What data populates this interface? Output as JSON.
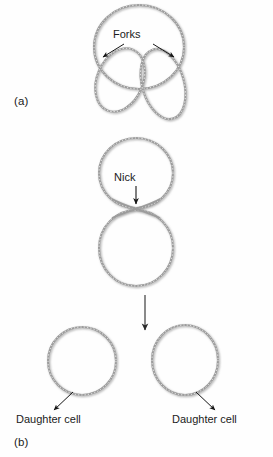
{
  "figure": {
    "background_color": "#fefefe",
    "stroke_color": "#9a9a9a",
    "stroke_color_dark": "#7d7d7d",
    "text_color": "#1b1b1b",
    "arrow_color": "#161616",
    "width": 273,
    "height": 457
  },
  "panels": [
    {
      "letter": "(a)",
      "caption_letter": "(a)",
      "description": "theta replication intermediate",
      "labels": [
        {
          "name": "forks",
          "text": "Forks",
          "arrow_count": 2
        }
      ]
    },
    {
      "letter": "(b)",
      "caption_letter": "(b)",
      "description": "nicked chromosome separating into two daughter cells",
      "labels": [
        {
          "name": "nick",
          "text": "Nick",
          "arrow_count": 1
        },
        {
          "name": "daughter-cell-left",
          "text": "Daughter cell",
          "arrow_count": 1
        },
        {
          "name": "daughter-cell-right",
          "text": "Daughter cell",
          "arrow_count": 1
        }
      ]
    }
  ],
  "labels": {
    "panel_a": "(a)",
    "panel_b": "(b)",
    "forks": "Forks",
    "nick": "Nick",
    "daughter_cell_left": "Daughter cell",
    "daughter_cell_right": "Daughter cell"
  },
  "shapes": {
    "theta_outer_circle": {
      "cx": 139,
      "cy": 47,
      "rx": 45,
      "ry": 42
    },
    "theta_loop_left": {
      "cx": 119,
      "cy": 80,
      "rx": 22,
      "ry": 33
    },
    "theta_loop_right": {
      "cx": 164,
      "cy": 83,
      "rx": 21,
      "ry": 36
    },
    "nicked_circle_top": {
      "cx": 136,
      "cy": 173,
      "rx": 37,
      "ry": 35
    },
    "nicked_circle_bottom": {
      "cx": 136,
      "cy": 248,
      "rx": 37,
      "ry": 38
    },
    "daughter_circle_left": {
      "cx": 82,
      "cy": 361,
      "rx": 34,
      "ry": 34
    },
    "daughter_circle_right": {
      "cx": 185,
      "cy": 360,
      "rx": 33,
      "ry": 35
    }
  },
  "arrows": {
    "fork_left": {
      "x1": 124,
      "y1": 44,
      "x2": 103,
      "y2": 57
    },
    "fork_right": {
      "x1": 152,
      "y1": 44,
      "x2": 173,
      "y2": 57
    },
    "nick": {
      "x1": 136,
      "y1": 185,
      "x2": 136,
      "y2": 205
    },
    "division": {
      "x1": 145,
      "y1": 296,
      "x2": 145,
      "y2": 330
    },
    "daughter_left": {
      "x1": 72,
      "y1": 392,
      "x2": 53,
      "y2": 410
    },
    "daughter_right": {
      "x1": 196,
      "y1": 392,
      "x2": 215,
      "y2": 410
    }
  }
}
